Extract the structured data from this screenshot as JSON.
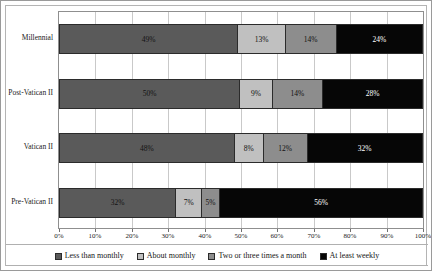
{
  "chart_data": {
    "type": "bar",
    "orientation": "horizontal",
    "stacked": true,
    "title": "",
    "subtitle": "",
    "xlabel": "",
    "ylabel": "",
    "xlim": [
      0,
      100
    ],
    "grid": true,
    "legend_position": "bottom",
    "categories": [
      "Millennial",
      "Post-Vatican II",
      "Vatican II",
      "Pre-Vatican II"
    ],
    "xtick_labels": [
      "0%",
      "10%",
      "20%",
      "30%",
      "40%",
      "50%",
      "60%",
      "70%",
      "80%",
      "90%",
      "100%"
    ],
    "xtick_values": [
      0,
      10,
      20,
      30,
      40,
      50,
      60,
      70,
      80,
      90,
      100
    ],
    "series": [
      {
        "name": "Less than monthly",
        "color": "#5a5a5a",
        "values": [
          49,
          50,
          48,
          32
        ],
        "labels": [
          "49%",
          "50%",
          "48%",
          "32%"
        ]
      },
      {
        "name": "About monthly",
        "color": "#c0c0c0",
        "values": [
          13,
          9,
          8,
          7
        ],
        "labels": [
          "13%",
          "9%",
          "8%",
          "7%"
        ]
      },
      {
        "name": "Two or three times a month",
        "color": "#8d8d8d",
        "values": [
          14,
          14,
          12,
          5
        ],
        "labels": [
          "14%",
          "14%",
          "12%",
          "5%"
        ]
      },
      {
        "name": "At least weekly",
        "color": "#060606",
        "values": [
          24,
          28,
          32,
          56
        ],
        "labels": [
          "24%",
          "28%",
          "32%",
          "56%"
        ]
      }
    ]
  }
}
